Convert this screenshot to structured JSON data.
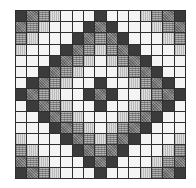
{
  "figure": {
    "type": "diamond-quilt-grid",
    "columns": 15,
    "rows_count": 15,
    "legend": {
      "D": {
        "name": "dark",
        "color": "#3b3b3b"
      },
      "M": {
        "name": "medium-stipple",
        "color": "#808080"
      },
      "G": {
        "name": "plaid-grid",
        "color": "#b4b4b4"
      },
      "V": {
        "name": "light-vertical-stripe",
        "color": "#dedede"
      },
      "W": {
        "name": "white",
        "color": "#f4f4f4"
      }
    },
    "rows": [
      "DMGVWWWDWWWVGMD",
      "MGVWWWDMDWWWVGM",
      "GVWWWDMGMDWWWVG",
      "VWWWDMGVGMDWWWV",
      "WWWDMGVWVGMDWWW",
      "WWDMGVWWWVGMDWW",
      "WDMGVWWDWWVGMDW",
      "DMGVWWDMDWWVGMD",
      "WDMGVWWDWWVGMDW",
      "WWDMGVWWWVGMDWW",
      "WWWDMGVWVGMDWWW",
      "VWWWDMGVGMDWWWV",
      "GVWWWDMGMDWWWVG",
      "MGVWWWDMDWWWVGM",
      "DMGVWWWDWWWVGMD"
    ]
  }
}
